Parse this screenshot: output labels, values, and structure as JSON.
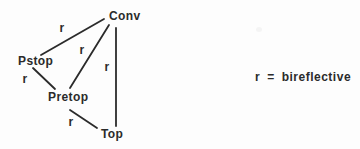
{
  "figure": {
    "nodes": [
      {
        "id": "conv",
        "label": "Conv"
      },
      {
        "id": "pstop",
        "label": "Pstop"
      },
      {
        "id": "pretop",
        "label": "Pretop"
      },
      {
        "id": "top",
        "label": "Top"
      }
    ],
    "edges": [
      {
        "from": "Pstop",
        "to": "Conv",
        "label": "r"
      },
      {
        "from": "Pretop",
        "to": "Conv",
        "label": "r"
      },
      {
        "from": "Top",
        "to": "Conv",
        "label": "r"
      },
      {
        "from": "Pstop",
        "to": "Pretop",
        "label": "r"
      },
      {
        "from": "Pretop",
        "to": "Top",
        "label": "r"
      }
    ],
    "legend": {
      "symbol": "r",
      "equals": "=",
      "meaning": "bireflective"
    }
  },
  "colors": {
    "ink": "#2b2b2b",
    "background": "#fdfdfd"
  }
}
